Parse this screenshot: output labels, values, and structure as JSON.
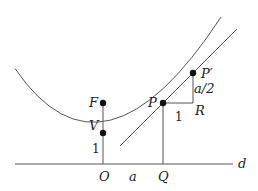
{
  "diagram": {
    "type": "parabola-tangent-geometry",
    "colors": {
      "stroke": "#555555",
      "point": "#111111",
      "text": "#222222"
    },
    "points": {
      "F": {
        "label": "F",
        "x": 103,
        "y": 103
      },
      "V": {
        "label": "V",
        "x": 103,
        "y": 133
      },
      "P": {
        "label": "P",
        "x": 163,
        "y": 103
      },
      "P_prime": {
        "label": "P′",
        "x": 193,
        "y": 73
      },
      "R": {
        "label": "R",
        "x": 193,
        "y": 103
      },
      "O": {
        "label": "O",
        "x": 103,
        "y": 164
      },
      "Q": {
        "label": "Q",
        "x": 163,
        "y": 164
      }
    },
    "line_label": "d",
    "segment_labels": {
      "OV": "1",
      "OQ": "a",
      "PR": "1",
      "RP_prime": "a/2"
    }
  }
}
